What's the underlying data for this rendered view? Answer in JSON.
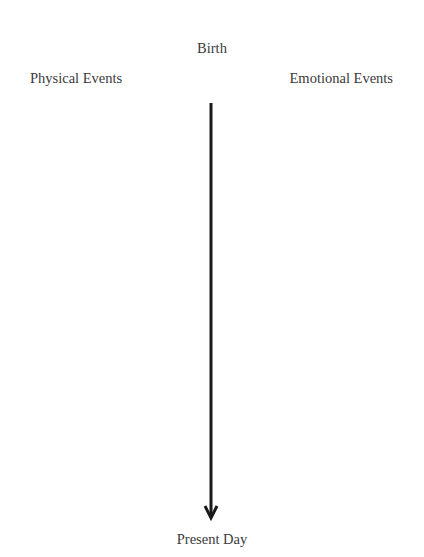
{
  "diagram": {
    "top_label": "Birth",
    "left_column_label": "Physical Events",
    "right_column_label": "Emotional Events",
    "bottom_label": "Present Day",
    "timeline_arrow": {
      "direction": "down",
      "color": "#1a1a1a"
    }
  }
}
